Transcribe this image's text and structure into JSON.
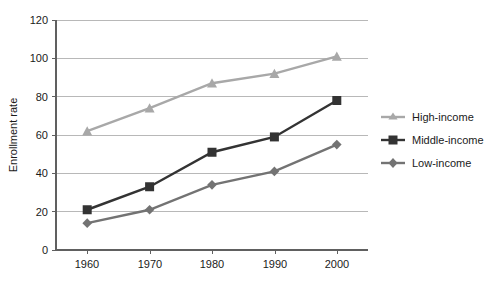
{
  "chart_data": {
    "type": "line",
    "title": "",
    "xlabel": "",
    "ylabel": "Enrollment rate",
    "categories": [
      "1960",
      "1970",
      "1980",
      "1990",
      "2000"
    ],
    "x": [
      1960,
      1970,
      1980,
      1990,
      2000
    ],
    "ylim": [
      0,
      120
    ],
    "yticks": [
      0,
      20,
      40,
      60,
      80,
      100,
      120
    ],
    "ytick_labels": [
      "0",
      "20",
      "40",
      "60",
      "80",
      "100",
      "120"
    ],
    "grid": "horizontal",
    "legend_position": "right",
    "series": [
      {
        "name": "High-income",
        "values": [
          62,
          74,
          87,
          92,
          101
        ],
        "color": "#a8a8a8",
        "marker": "triangle"
      },
      {
        "name": "Middle-income",
        "values": [
          21,
          33,
          51,
          59,
          78
        ],
        "color": "#333333",
        "marker": "square"
      },
      {
        "name": "Low-income",
        "values": [
          14,
          21,
          34,
          41,
          55
        ],
        "color": "#737373",
        "marker": "diamond"
      }
    ]
  },
  "axes": {
    "y_title": "Enrollment rate",
    "y_ticks": [
      "120",
      "100",
      "80",
      "60",
      "40",
      "20",
      "0"
    ],
    "x_ticks": [
      "1960",
      "1970",
      "1980",
      "1990",
      "2000"
    ]
  },
  "legend": {
    "items": [
      {
        "label": "High-income",
        "color": "#a8a8a8",
        "marker": "triangle-marker"
      },
      {
        "label": "Middle-income",
        "color": "#333333",
        "marker": "square-marker"
      },
      {
        "label": "Low-income",
        "color": "#737373",
        "marker": "diamond-marker"
      }
    ]
  }
}
